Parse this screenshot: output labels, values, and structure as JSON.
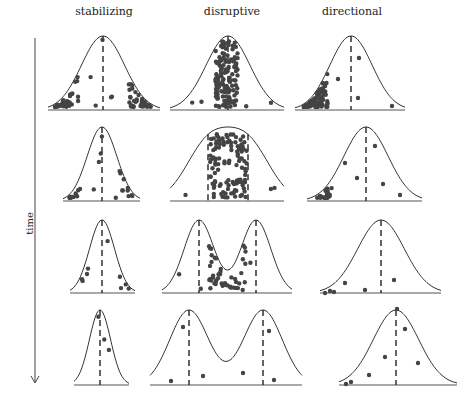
{
  "columns": [
    {
      "label": "stabilizing",
      "x": 104
    },
    {
      "label": "disruptive",
      "x": 232
    },
    {
      "label": "directional",
      "x": 352
    }
  ],
  "axis": {
    "label": "time",
    "direction": "down"
  },
  "rows": [
    {
      "stabilizing": {
        "base": 110,
        "peak": 36,
        "x0": 48,
        "x1": 160,
        "means": [
          103
        ],
        "shape": "unimodal",
        "dots": "many at both tails, few in center"
      },
      "disruptive": {
        "base": 110,
        "peak": 36,
        "x0": 170,
        "x1": 284,
        "means": [
          228
        ],
        "shape": "unimodal",
        "dots": "dense column in center"
      },
      "directional": {
        "base": 110,
        "peak": 36,
        "x0": 295,
        "x1": 405,
        "means": [
          351
        ],
        "shape": "unimodal",
        "dots": "dense on left side"
      }
    },
    {
      "stabilizing": {
        "base": 201,
        "peak": 127,
        "x0": 63,
        "x1": 140,
        "means": [
          102
        ],
        "shape": "unimodal",
        "dots": "clusters at tails"
      },
      "disruptive": {
        "base": 201,
        "peak": 127,
        "x0": 170,
        "x1": 284,
        "means": [
          208,
          248
        ],
        "shape": "flat-top dip",
        "dots": "dense center"
      },
      "directional": {
        "base": 201,
        "peak": 127,
        "x0": 307,
        "x1": 422,
        "means": [
          366
        ],
        "shape": "unimodal",
        "dots": "cluster at left tail"
      }
    },
    {
      "stabilizing": {
        "base": 293,
        "peak": 220,
        "x0": 70,
        "x1": 135,
        "means": [
          102
        ],
        "shape": "unimodal narrow"
      },
      "disruptive": {
        "base": 293,
        "peak": 220,
        "x0": 162,
        "x1": 292,
        "means": [
          199,
          256
        ],
        "shape": "bimodal"
      },
      "directional": {
        "base": 293,
        "peak": 220,
        "x0": 320,
        "x1": 441,
        "means": [
          381
        ],
        "shape": "unimodal"
      }
    },
    {
      "stabilizing": {
        "base": 385,
        "peak": 310,
        "x0": 74,
        "x1": 129,
        "means": [
          100
        ],
        "shape": "unimodal narrow"
      },
      "disruptive": {
        "base": 385,
        "peak": 310,
        "x0": 150,
        "x1": 302,
        "means": [
          189,
          263
        ],
        "shape": "two separate peaks"
      },
      "directional": {
        "base": 385,
        "peak": 310,
        "x0": 339,
        "x1": 457,
        "means": [
          396
        ],
        "shape": "unimodal"
      }
    }
  ]
}
